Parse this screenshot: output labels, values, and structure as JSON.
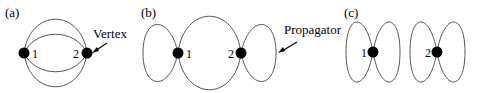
{
  "figure": {
    "panels": [
      {
        "id": "a",
        "label": "(a)",
        "vertices": [
          {
            "label": "1"
          },
          {
            "label": "2"
          }
        ],
        "annotation": "Vertex",
        "description": "Two vertices connected by four propagator lines"
      },
      {
        "id": "b",
        "label": "(b)",
        "vertices": [
          {
            "label": "1"
          },
          {
            "label": "2"
          }
        ],
        "annotation": "Propagator",
        "description": "Two vertices joined by two lines, each with a self-loop"
      },
      {
        "id": "c",
        "label": "(c)",
        "vertices": [
          {
            "label": "1"
          },
          {
            "label": "2"
          }
        ],
        "annotation": "",
        "description": "Two disconnected vertices, each with two self-loops"
      }
    ],
    "colors": {
      "line": "#555555",
      "vertex": "#000000",
      "text": "#000000"
    }
  }
}
